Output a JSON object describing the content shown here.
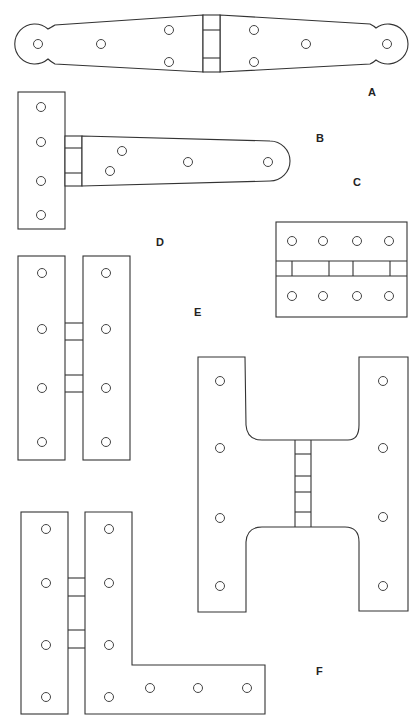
{
  "labels": {
    "A": "A",
    "B": "B",
    "C": "C",
    "D": "D",
    "E": "E",
    "F": "F"
  },
  "hinges": [
    {
      "id": "A",
      "type": "strap hinge with rounded ends",
      "holes": 8
    },
    {
      "id": "B",
      "type": "T-hinge",
      "holes": 8
    },
    {
      "id": "C",
      "type": "butt hinge",
      "holes": 8
    },
    {
      "id": "D",
      "type": "H-type flat hinge",
      "holes": 8
    },
    {
      "id": "E",
      "type": "parliament H hinge",
      "holes": 8
    },
    {
      "id": "F",
      "type": "H-L hinge",
      "holes": 11
    }
  ],
  "colors": {
    "stroke": "#333333",
    "background": "#ffffff"
  }
}
